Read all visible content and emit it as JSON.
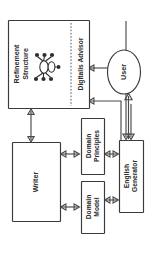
{
  "diagram": {
    "orientation": "rotated-90-ccw",
    "nodes": {
      "refinement_structure": {
        "label_line1": "Refinement",
        "label_line2": "Structure",
        "icon": "node-graph-icon"
      },
      "digitalis_advisor": {
        "label": "Digitalis Advisor"
      },
      "user": {
        "label": "User"
      },
      "writer": {
        "label": "Writer"
      },
      "domain_principles": {
        "label_line1": "Domain",
        "label_line2": "Principles"
      },
      "domain_model": {
        "label_line1": "Domain",
        "label_line2": "Model"
      },
      "english_generator": {
        "label_line1": "English",
        "label_line2": "Generator"
      }
    },
    "colors": {
      "stroke": "#3b3b3b",
      "connector": "#4a4a4a",
      "text": "#2b2b2b",
      "background": "#ffffff"
    }
  }
}
